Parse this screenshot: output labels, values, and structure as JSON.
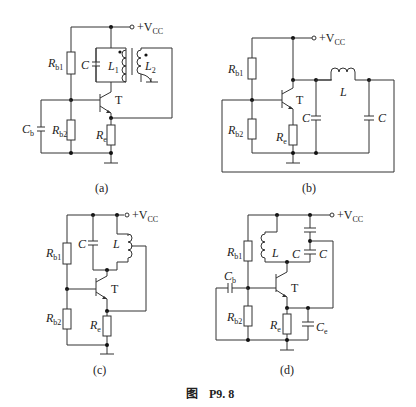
{
  "figure": {
    "prefix": "图",
    "number": "P9. 8"
  },
  "common_labels": {
    "vcc": "+V",
    "vcc_sub": "CC",
    "transistor": "T"
  },
  "circuits": [
    {
      "id": "a",
      "caption": "(a)",
      "components": {
        "rb1": {
          "main": "R",
          "sub": "b1"
        },
        "rb2": {
          "main": "R",
          "sub": "b2"
        },
        "re": {
          "main": "R",
          "sub": "e"
        },
        "cb": {
          "main": "C",
          "sub": "b"
        },
        "c": {
          "main": "C"
        },
        "l1": {
          "main": "L",
          "sub": "1"
        },
        "l2": {
          "main": "L",
          "sub": "2"
        }
      }
    },
    {
      "id": "b",
      "caption": "(b)",
      "components": {
        "rb1": {
          "main": "R",
          "sub": "b1"
        },
        "rb2": {
          "main": "R",
          "sub": "b2"
        },
        "re": {
          "main": "R",
          "sub": "e"
        },
        "c_left": {
          "main": "C"
        },
        "c_right": {
          "main": "C"
        },
        "l": {
          "main": "L"
        }
      }
    },
    {
      "id": "c",
      "caption": "(c)",
      "components": {
        "rb1": {
          "main": "R",
          "sub": "b1"
        },
        "rb2": {
          "main": "R",
          "sub": "b2"
        },
        "re": {
          "main": "R",
          "sub": "e"
        },
        "c": {
          "main": "C"
        },
        "l": {
          "main": "L"
        }
      }
    },
    {
      "id": "d",
      "caption": "(d)",
      "components": {
        "rb1": {
          "main": "R",
          "sub": "b1"
        },
        "rb2": {
          "main": "R",
          "sub": "b2"
        },
        "re": {
          "main": "R",
          "sub": "e"
        },
        "cb": {
          "main": "C",
          "sub": "b"
        },
        "ce": {
          "main": "C",
          "sub": "e"
        },
        "c_top": {
          "main": "C"
        },
        "c_bottom": {
          "main": "C"
        },
        "l": {
          "main": "L"
        }
      }
    }
  ]
}
